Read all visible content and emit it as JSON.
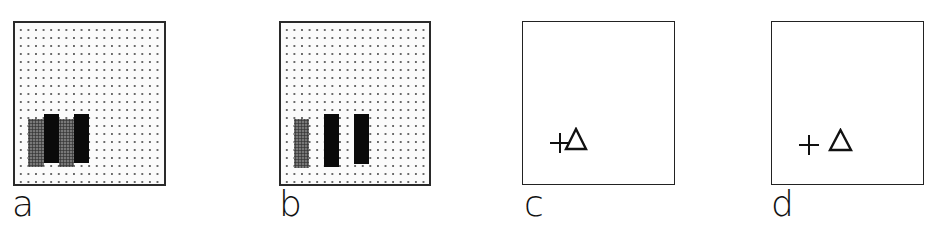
{
  "panels": [
    {
      "label": "a",
      "background": "dotted-grid",
      "bars": [
        {
          "fill": "gray",
          "x": 28,
          "y": 119,
          "w": 16,
          "h": 48
        },
        {
          "fill": "black",
          "x": 44,
          "y": 114,
          "w": 15,
          "h": 49
        },
        {
          "fill": "gray",
          "x": 59,
          "y": 119,
          "w": 15,
          "h": 48
        },
        {
          "fill": "black",
          "x": 74,
          "y": 114,
          "w": 15,
          "h": 49
        }
      ]
    },
    {
      "label": "b",
      "background": "dotted-grid",
      "bars": [
        {
          "fill": "gray",
          "x": 294,
          "y": 119,
          "w": 15,
          "h": 49
        },
        {
          "fill": "black",
          "x": 324,
          "y": 114,
          "w": 15,
          "h": 53
        },
        {
          "fill": "black",
          "x": 354,
          "y": 114,
          "w": 15,
          "h": 50
        }
      ]
    },
    {
      "label": "c",
      "background": "plain",
      "symbols": [
        {
          "type": "plus",
          "cx": 560,
          "cy": 143
        },
        {
          "type": "triangle",
          "x": 565,
          "y": 128,
          "w": 21,
          "h": 21
        }
      ]
    },
    {
      "label": "d",
      "background": "plain",
      "symbols": [
        {
          "type": "plus",
          "cx": 808,
          "cy": 144
        },
        {
          "type": "triangle",
          "x": 829,
          "y": 130,
          "w": 22,
          "h": 20
        }
      ]
    }
  ],
  "colors": {
    "frame": "#222222",
    "black_bar": "#0a0a0a",
    "gray_bar": "#6d6d6d",
    "dot": "#6a6a6a"
  }
}
